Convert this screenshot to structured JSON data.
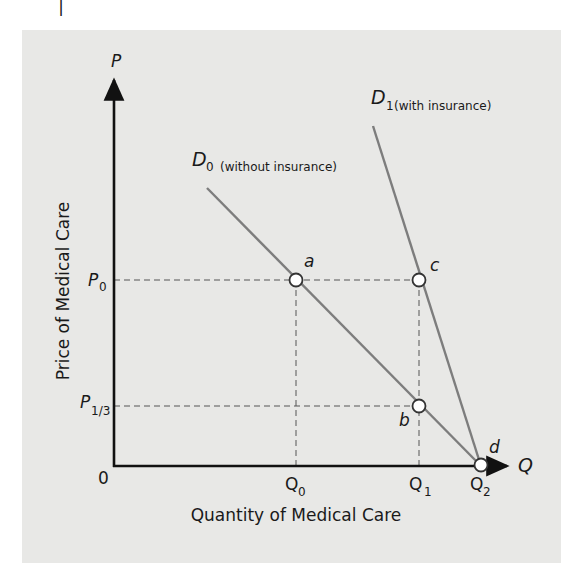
{
  "diagram": {
    "type": "supply-demand",
    "axes": {
      "y_symbol": "P",
      "x_symbol": "Q",
      "origin": "0",
      "y_label": "Price of Medical Care",
      "x_label": "Quantity of Medical Care"
    },
    "price_levels": [
      {
        "symbol": "P",
        "sub": "0"
      },
      {
        "symbol": "P",
        "sub": "1/3"
      }
    ],
    "quantity_levels": [
      {
        "symbol": "Q",
        "sub": "0"
      },
      {
        "symbol": "Q",
        "sub": "1"
      },
      {
        "symbol": "Q",
        "sub": "2"
      }
    ],
    "curves": [
      {
        "symbol": "D",
        "sub": "0",
        "desc": "(without insurance)"
      },
      {
        "symbol": "D",
        "sub": "1",
        "desc": "(with insurance)"
      }
    ],
    "points": [
      "a",
      "b",
      "c",
      "d"
    ],
    "colors": {
      "panel": "#e8e8e6",
      "axis": "#111111",
      "curve": "#7d7d7d",
      "dashed": "#555555",
      "point_fill": "#ffffff",
      "point_stroke": "#333333"
    }
  }
}
